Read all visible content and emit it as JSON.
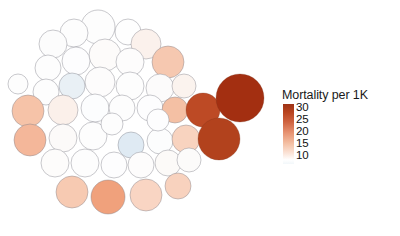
{
  "figure": {
    "background_color": "#ffffff",
    "width": 400,
    "height": 236
  },
  "legend": {
    "title": "Mortality per 1K",
    "ticks": [
      "30",
      "25",
      "20",
      "15",
      "10"
    ],
    "colorbar_top_color": "#9e3316",
    "colorbar_bottom_color": "#ffffff",
    "colorbar_low_color": "#d8e7f0"
  },
  "chart_data": {
    "type": "scatter",
    "title": "",
    "subtitle": "",
    "xlabel": "",
    "ylabel": "",
    "legend_title": "Mortality per 1K",
    "legend_position": "right",
    "grid": false,
    "colormap": "RdBu_r",
    "color_scale_ticks": [
      30,
      25,
      20,
      15,
      10
    ],
    "color_scale_range": [
      8,
      32
    ],
    "size_encoding": "population",
    "note": "circle-packing bubble map; x/y are pixel centers, r is pixel radius, v is mortality per 1K",
    "points": [
      {
        "x": 98,
        "y": 27,
        "r": 17,
        "v": 13.2,
        "fill": "#fdfdfd"
      },
      {
        "x": 74,
        "y": 33,
        "r": 14,
        "v": 13.4,
        "fill": "#fdfdfd"
      },
      {
        "x": 128,
        "y": 32,
        "r": 13,
        "v": 13.0,
        "fill": "#fefefe"
      },
      {
        "x": 53,
        "y": 44,
        "r": 14,
        "v": 13.6,
        "fill": "#fcfcfc"
      },
      {
        "x": 146,
        "y": 44,
        "r": 15,
        "v": 14.8,
        "fill": "#fbf1ec"
      },
      {
        "x": 105,
        "y": 55,
        "r": 16,
        "v": 13.8,
        "fill": "#fdfbfa"
      },
      {
        "x": 76,
        "y": 61,
        "r": 14,
        "v": 13.1,
        "fill": "#fdfdfe"
      },
      {
        "x": 130,
        "y": 62,
        "r": 14,
        "v": 13.5,
        "fill": "#fdfcfc"
      },
      {
        "x": 48,
        "y": 68,
        "r": 13,
        "v": 13.2,
        "fill": "#fdfdfd"
      },
      {
        "x": 168,
        "y": 62,
        "r": 16,
        "v": 17.2,
        "fill": "#f6c8b0"
      },
      {
        "x": 100,
        "y": 82,
        "r": 15,
        "v": 13.7,
        "fill": "#fdfcfc"
      },
      {
        "x": 72,
        "y": 86,
        "r": 13,
        "v": 12.4,
        "fill": "#e9f0f5"
      },
      {
        "x": 130,
        "y": 86,
        "r": 14,
        "v": 13.3,
        "fill": "#fdfdfd"
      },
      {
        "x": 46,
        "y": 92,
        "r": 13,
        "v": 13.4,
        "fill": "#fdfdfd"
      },
      {
        "x": 160,
        "y": 88,
        "r": 14,
        "v": 13.9,
        "fill": "#fcfbfb"
      },
      {
        "x": 184,
        "y": 86,
        "r": 12,
        "v": 14.4,
        "fill": "#fbf3ee"
      },
      {
        "x": 28,
        "y": 111,
        "r": 16,
        "v": 18.8,
        "fill": "#f6c3a8"
      },
      {
        "x": 63,
        "y": 110,
        "r": 15,
        "v": 14.2,
        "fill": "#fbf0ea"
      },
      {
        "x": 95,
        "y": 108,
        "r": 14,
        "v": 13.2,
        "fill": "#fcfdfe"
      },
      {
        "x": 122,
        "y": 108,
        "r": 13,
        "v": 13.3,
        "fill": "#fdfdfd"
      },
      {
        "x": 150,
        "y": 108,
        "r": 13,
        "v": 13.0,
        "fill": "#fdfdfe"
      },
      {
        "x": 175,
        "y": 110,
        "r": 13,
        "v": 17.6,
        "fill": "#f4c0a4"
      },
      {
        "x": 203,
        "y": 110,
        "r": 17,
        "v": 27.6,
        "fill": "#bd4a25"
      },
      {
        "x": 240,
        "y": 98,
        "r": 24,
        "v": 31.0,
        "fill": "#a32f11"
      },
      {
        "x": 30,
        "y": 140,
        "r": 16,
        "v": 19.6,
        "fill": "#f4b79a"
      },
      {
        "x": 63,
        "y": 138,
        "r": 14,
        "v": 13.6,
        "fill": "#fcfaf9"
      },
      {
        "x": 93,
        "y": 136,
        "r": 14,
        "v": 13.4,
        "fill": "#fdfdfd"
      },
      {
        "x": 131,
        "y": 145,
        "r": 13,
        "v": 11.8,
        "fill": "#dfeaf3"
      },
      {
        "x": 160,
        "y": 141,
        "r": 13,
        "v": 13.1,
        "fill": "#fcfdfd"
      },
      {
        "x": 186,
        "y": 139,
        "r": 14,
        "v": 16.8,
        "fill": "#f8d3bf"
      },
      {
        "x": 219,
        "y": 139,
        "r": 21,
        "v": 29.0,
        "fill": "#b2421d"
      },
      {
        "x": 55,
        "y": 163,
        "r": 14,
        "v": 13.8,
        "fill": "#fdfcfb"
      },
      {
        "x": 85,
        "y": 163,
        "r": 14,
        "v": 13.3,
        "fill": "#fdfdfd"
      },
      {
        "x": 114,
        "y": 165,
        "r": 13,
        "v": 13.2,
        "fill": "#fdfdfe"
      },
      {
        "x": 141,
        "y": 165,
        "r": 13,
        "v": 13.5,
        "fill": "#fdfcfc"
      },
      {
        "x": 168,
        "y": 163,
        "r": 13,
        "v": 14.0,
        "fill": "#fcfaf8"
      },
      {
        "x": 72,
        "y": 192,
        "r": 16,
        "v": 18.0,
        "fill": "#f7cab2"
      },
      {
        "x": 108,
        "y": 197,
        "r": 17,
        "v": 20.8,
        "fill": "#f0a17c"
      },
      {
        "x": 146,
        "y": 195,
        "r": 16,
        "v": 17.2,
        "fill": "#f9d5c3"
      },
      {
        "x": 178,
        "y": 186,
        "r": 13,
        "v": 17.0,
        "fill": "#f8d2be"
      },
      {
        "x": 189,
        "y": 160,
        "r": 12,
        "v": 13.6,
        "fill": "#fcfbfa"
      },
      {
        "x": 158,
        "y": 120,
        "r": 11,
        "v": 13.1,
        "fill": "#fdfdfe"
      },
      {
        "x": 112,
        "y": 124,
        "r": 11,
        "v": 13.4,
        "fill": "#fdfdfd"
      },
      {
        "x": 18,
        "y": 84,
        "r": 10,
        "v": 13.5,
        "fill": "#fdfdfd"
      }
    ]
  }
}
